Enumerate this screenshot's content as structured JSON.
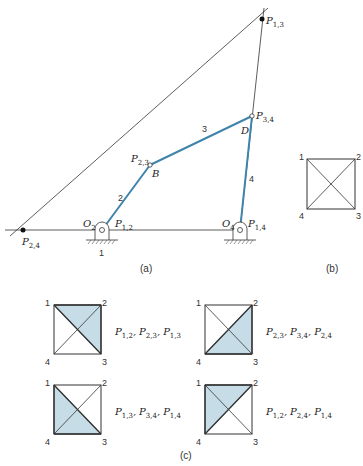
{
  "figure": {
    "panel_a": {
      "caption": "(a)",
      "points": {
        "P13": {
          "P": "P",
          "sub": "1,3"
        },
        "P34": {
          "P": "P",
          "sub": "3,4"
        },
        "P23": {
          "P": "P",
          "sub": "2,3"
        },
        "P24": {
          "P": "P",
          "sub": "2,4"
        },
        "P12": {
          "P": "P",
          "sub": "1,2"
        },
        "P14": {
          "P": "P",
          "sub": "1,4"
        },
        "O2": {
          "P": "O",
          "sub": "2"
        },
        "O4": {
          "P": "O",
          "sub": "4"
        },
        "B": "B",
        "D": "D"
      },
      "link_numbers": {
        "ground": "1",
        "crank": "2",
        "coupler": "3",
        "rocker": "4"
      }
    },
    "panel_b": {
      "caption": "(b)",
      "corners": [
        "1",
        "2",
        "3",
        "4"
      ]
    },
    "panel_c": {
      "caption": "(c)",
      "diagrams": [
        {
          "corners": [
            "1",
            "2",
            "3",
            "4"
          ],
          "shaded": "1-2-3",
          "labels": [
            {
              "P": "P",
              "sub": "1,2"
            },
            {
              "P": "P",
              "sub": "2,3"
            },
            {
              "P": "P",
              "sub": "1,3"
            }
          ]
        },
        {
          "corners": [
            "1",
            "2",
            "3",
            "4"
          ],
          "shaded": "2-3-4",
          "labels": [
            {
              "P": "P",
              "sub": "2,3"
            },
            {
              "P": "P",
              "sub": "3,4"
            },
            {
              "P": "P",
              "sub": "2,4"
            }
          ]
        },
        {
          "corners": [
            "1",
            "2",
            "3",
            "4"
          ],
          "shaded": "1-3-4",
          "labels": [
            {
              "P": "P",
              "sub": "1,3"
            },
            {
              "P": "P",
              "sub": "3,4"
            },
            {
              "P": "P",
              "sub": "1,4"
            }
          ]
        },
        {
          "corners": [
            "1",
            "2",
            "3",
            "4"
          ],
          "shaded": "1-2-4",
          "labels": [
            {
              "P": "P",
              "sub": "1,2"
            },
            {
              "P": "P",
              "sub": "2,4"
            },
            {
              "P": "P",
              "sub": "1,4"
            }
          ]
        }
      ]
    },
    "colors": {
      "link": "#3f84ab",
      "shade": "#c6dde8",
      "line": "#333333"
    }
  }
}
